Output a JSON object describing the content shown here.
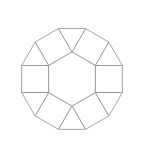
{
  "figure": {
    "background_color": "#ffffff",
    "stroke_color": "#8c8c8c",
    "fill_color": "#ffffff",
    "stroke_width": 0.8,
    "canvas": {
      "width": 144,
      "height": 160
    }
  },
  "geometry": {
    "center": {
      "x": 72,
      "y": 79
    },
    "hexagon_circumradius": 27,
    "hexagon_rotation_deg": 90,
    "square_side": 27,
    "triangle_side": 27,
    "face_counts": {
      "hexagon": 1,
      "squares": 6,
      "triangles": 6
    },
    "total_faces": 13
  },
  "faces": [
    {
      "id": "hexagon-center",
      "name": "center-hexagon",
      "kind": "hexagon",
      "points": "72,52 95.38,65.5 95.38,92.5 72,106 48.62,92.5 48.62,65.5"
    },
    {
      "id": "square-top-left",
      "name": "square-upper-left",
      "kind": "square",
      "points": "48.62,65.5 72,52 58.5,28.62 35.12,42.12"
    },
    {
      "id": "square-top-right",
      "name": "square-upper-right",
      "kind": "square",
      "points": "72,52 95.38,65.5 108.88,42.12 85.5,28.62"
    },
    {
      "id": "square-right",
      "name": "square-right",
      "kind": "square",
      "points": "95.38,65.5 95.38,92.5 122.38,92.5 122.38,65.5"
    },
    {
      "id": "square-bottom-right",
      "name": "square-lower-right",
      "kind": "square",
      "points": "95.38,92.5 72,106 85.5,129.38 108.88,115.88"
    },
    {
      "id": "square-bottom-left",
      "name": "square-lower-left",
      "kind": "square",
      "points": "72,106 48.62,92.5 35.12,115.88 58.5,129.38"
    },
    {
      "id": "square-left",
      "name": "square-left",
      "kind": "square",
      "points": "48.62,92.5 48.62,65.5 21.62,65.5 21.62,92.5"
    },
    {
      "id": "triangle-top",
      "name": "triangle-top-center",
      "kind": "triangle",
      "points": "72,52 58.5,28.62 85.5,28.62"
    },
    {
      "id": "triangle-upper-right",
      "name": "triangle-upper-right",
      "kind": "triangle",
      "points": "95.38,65.5 108.88,42.12 122.38,65.5"
    },
    {
      "id": "triangle-lower-right",
      "name": "triangle-lower-right",
      "kind": "triangle",
      "points": "95.38,92.5 122.38,92.5 108.88,115.88"
    },
    {
      "id": "triangle-bottom",
      "name": "triangle-bottom-center",
      "kind": "triangle",
      "points": "72,106 85.5,129.38 58.5,129.38"
    },
    {
      "id": "triangle-lower-left",
      "name": "triangle-lower-left",
      "kind": "triangle",
      "points": "48.62,92.5 35.12,115.88 21.62,92.5"
    },
    {
      "id": "triangle-upper-left",
      "name": "triangle-upper-left",
      "kind": "triangle",
      "points": "48.62,65.5 21.62,65.5 35.12,42.12"
    }
  ]
}
